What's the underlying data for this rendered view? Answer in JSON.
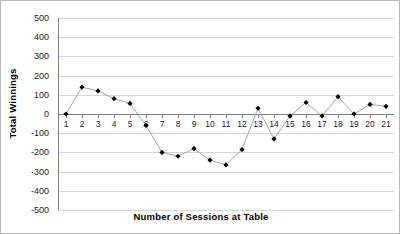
{
  "chart_data": {
    "type": "line",
    "title": "",
    "xlabel": "Number of Sessions at Table",
    "ylabel": "Total Winnings",
    "x": [
      1,
      2,
      3,
      4,
      5,
      6,
      7,
      8,
      9,
      10,
      11,
      12,
      13,
      14,
      15,
      16,
      17,
      18,
      19,
      20,
      21
    ],
    "categories": [
      "1",
      "2",
      "3",
      "4",
      "5",
      "6",
      "7",
      "8",
      "9",
      "10",
      "11",
      "12",
      "13",
      "14",
      "15",
      "16",
      "17",
      "18",
      "19",
      "20",
      "21"
    ],
    "values": [
      0,
      140,
      120,
      80,
      55,
      -60,
      -200,
      -220,
      -180,
      -240,
      -265,
      -185,
      30,
      -130,
      -10,
      60,
      -10,
      90,
      0,
      50,
      40
    ],
    "series": [
      {
        "name": "Total Winnings",
        "values": [
          0,
          140,
          120,
          80,
          55,
          -60,
          -200,
          -220,
          -180,
          -240,
          -265,
          -185,
          30,
          -130,
          -10,
          60,
          -10,
          90,
          0,
          50,
          40
        ]
      }
    ],
    "ylim": [
      -500,
      500
    ],
    "ytick_step": 100,
    "yticks": [
      500,
      400,
      300,
      200,
      100,
      0,
      -100,
      -200,
      -300,
      -400,
      -500
    ],
    "ytick_labels": [
      "500",
      "400",
      "300",
      "200",
      "100",
      "0",
      "-100",
      "-200",
      "-300",
      "-400",
      "-500"
    ],
    "xlim": [
      0.5,
      21.5
    ],
    "grid": true,
    "grid_axis": "y",
    "legend": false,
    "legend_position": "none",
    "marker": "diamond",
    "marker_color": "#000000",
    "line_color": "#9a9a9a",
    "grid_color": "#d4d4d4",
    "axis_color": "#808080",
    "background_color": "#ffffff",
    "border_color": "#b9b9b9"
  }
}
